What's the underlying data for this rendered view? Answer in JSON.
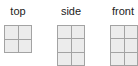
{
  "views": [
    {
      "label": "top",
      "cols": 2,
      "rows": 2
    },
    {
      "label": "side",
      "cols": 2,
      "rows": 3
    },
    {
      "label": "front",
      "cols": 2,
      "rows": 3
    }
  ],
  "colors": {
    "cell_fill": "#ececec",
    "grid_line": "#a3a3a3",
    "label_text": "#222222"
  }
}
